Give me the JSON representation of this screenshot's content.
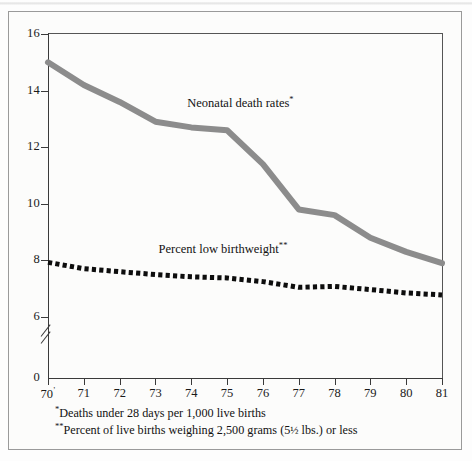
{
  "figure": {
    "frame_color": "#9a9a9a",
    "background": "#fcfcfb"
  },
  "footnotes": {
    "line1_marker": "*",
    "line1": "Deaths under 28 days per 1,000 live births",
    "line2_marker": "**",
    "line2_a": "Percent of live births weighing 2,500 grams (5",
    "line2_frac": "½",
    "line2_b": " lbs.) or less"
  },
  "chart_data": {
    "type": "line",
    "title": "",
    "subtitle": "",
    "xlabel": "",
    "ylabel": "",
    "grid": false,
    "legend_position": "inline-annotation",
    "axis_break": true,
    "axis_break_between": [
      0,
      6
    ],
    "x": [
      "70",
      "71",
      "72",
      "73",
      "74",
      "75",
      "76",
      "77",
      "78",
      "79",
      "80",
      "81"
    ],
    "x_tick_labels": [
      "70",
      "71",
      "72",
      "73",
      "74",
      "75",
      "76",
      "77",
      "78",
      "79",
      "80",
      "81"
    ],
    "x_first_label_superscript": "’",
    "y_tick_labels": [
      "16",
      "14",
      "12",
      "10",
      "8",
      "6",
      "0"
    ],
    "y_tick_values": [
      16,
      14,
      12,
      10,
      8,
      6,
      0
    ],
    "ylim": [
      6,
      16
    ],
    "series": [
      {
        "name": "Neonatal death rates*",
        "label": "Neonatal death rates",
        "label_marker": "*",
        "color": "#8c8c8c",
        "style": "solid",
        "width": 6,
        "values": [
          15.0,
          14.2,
          13.6,
          12.9,
          12.7,
          12.6,
          11.4,
          9.8,
          9.6,
          8.8,
          8.3,
          7.9
        ]
      },
      {
        "name": "Percent low birthweight**",
        "label": "Percent low birthweight",
        "label_marker": "**",
        "color": "#0d0d0d",
        "style": "dotted",
        "width": 5,
        "values": [
          7.93,
          7.71,
          7.6,
          7.5,
          7.42,
          7.38,
          7.25,
          7.05,
          7.08,
          6.97,
          6.85,
          6.78
        ]
      }
    ],
    "annotations": [
      {
        "text": "Neonatal death rates*",
        "x_year": "74",
        "y_value": 13.6
      },
      {
        "text": "Percent low birthweight**",
        "x_year": "73.2",
        "y_value": 8.45
      }
    ]
  }
}
